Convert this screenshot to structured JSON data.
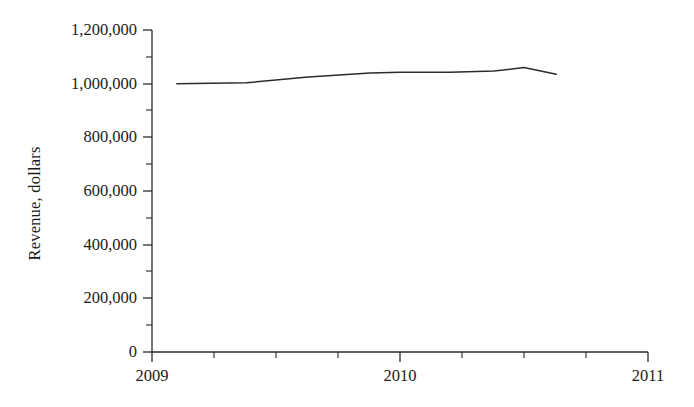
{
  "chart_data": {
    "type": "line",
    "title": "",
    "xlabel": "",
    "ylabel": "Revenue, dollars",
    "xlim": [
      2009,
      2011
    ],
    "ylim": [
      0,
      1200000
    ],
    "grid": false,
    "legend": "none",
    "y_ticks": [
      0,
      200000,
      400000,
      600000,
      800000,
      1000000,
      1200000
    ],
    "y_tick_labels": [
      "0",
      "200,000",
      "400,000",
      "600,000",
      "800,000",
      "1,000,000",
      "1,200,000"
    ],
    "y_minor_tick_step": 100000,
    "x_ticks": [
      2009,
      2010,
      2011
    ],
    "x_tick_labels": [
      "2009",
      "2011",
      "2010"
    ],
    "x_tick_labels_ordered": [
      "2009",
      "2010",
      "2011"
    ],
    "x_minor_tick_step": 0.25,
    "series": [
      {
        "name": "Revenue",
        "color": "#2b2b2b",
        "x": [
          2009.1,
          2009.38,
          2009.63,
          2009.88,
          2010.0,
          2010.2,
          2010.38,
          2010.5,
          2010.63
        ],
        "values": [
          1000000,
          1003000,
          1025000,
          1040000,
          1043000,
          1043000,
          1047000,
          1060000,
          1035000
        ]
      }
    ]
  },
  "axis": {
    "line_color": "#2b2b2b"
  }
}
